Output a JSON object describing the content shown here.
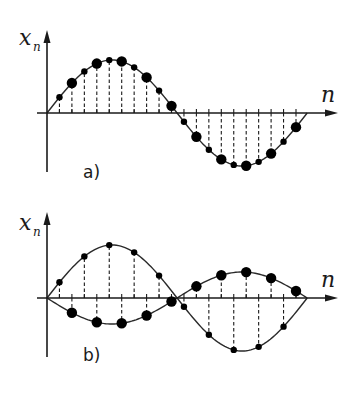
{
  "figure": {
    "panels": [
      {
        "id": "a",
        "label": "a)",
        "y_axis_label": "x",
        "y_axis_subscript": "n",
        "x_axis_label": "n",
        "description": "One period of a sampled sinusoid; dashed stems from axis to each sample; alternating large and small dots",
        "samples": 20,
        "curves": [
          {
            "name": "sinusoid",
            "amplitude_rel": 1.0,
            "shape": "full-period sine",
            "dot_pattern": "odd n small, even n large"
          }
        ]
      },
      {
        "id": "b",
        "label": "b)",
        "y_axis_label": "x",
        "y_axis_subscript": "n",
        "x_axis_label": "n",
        "description": "Two interleaved sampled curves: small dots (odd n) follow a large-amplitude sine; large dots (even n) follow an inverted small-amplitude sine",
        "samples": 20,
        "curves": [
          {
            "name": "odd-samples",
            "amplitude_rel": 1.0,
            "shape": "positive half then negative half",
            "dot": "small"
          },
          {
            "name": "even-samples",
            "amplitude_rel": 0.5,
            "shape": "negative half then positive half",
            "dot": "large"
          }
        ]
      }
    ]
  },
  "geometry": {
    "x0": 47,
    "dx": 6.2,
    "n_end": 20.9,
    "panel_a": {
      "y_axis": 113,
      "amp": 53,
      "y_top": 30,
      "y_bottom": 172,
      "x_arrow_end": 338
    },
    "panel_b": {
      "y_axis": 298,
      "amp_big": 53,
      "amp_small": 26,
      "y_top": 212,
      "y_bottom": 357,
      "x_arrow_end": 338
    }
  }
}
